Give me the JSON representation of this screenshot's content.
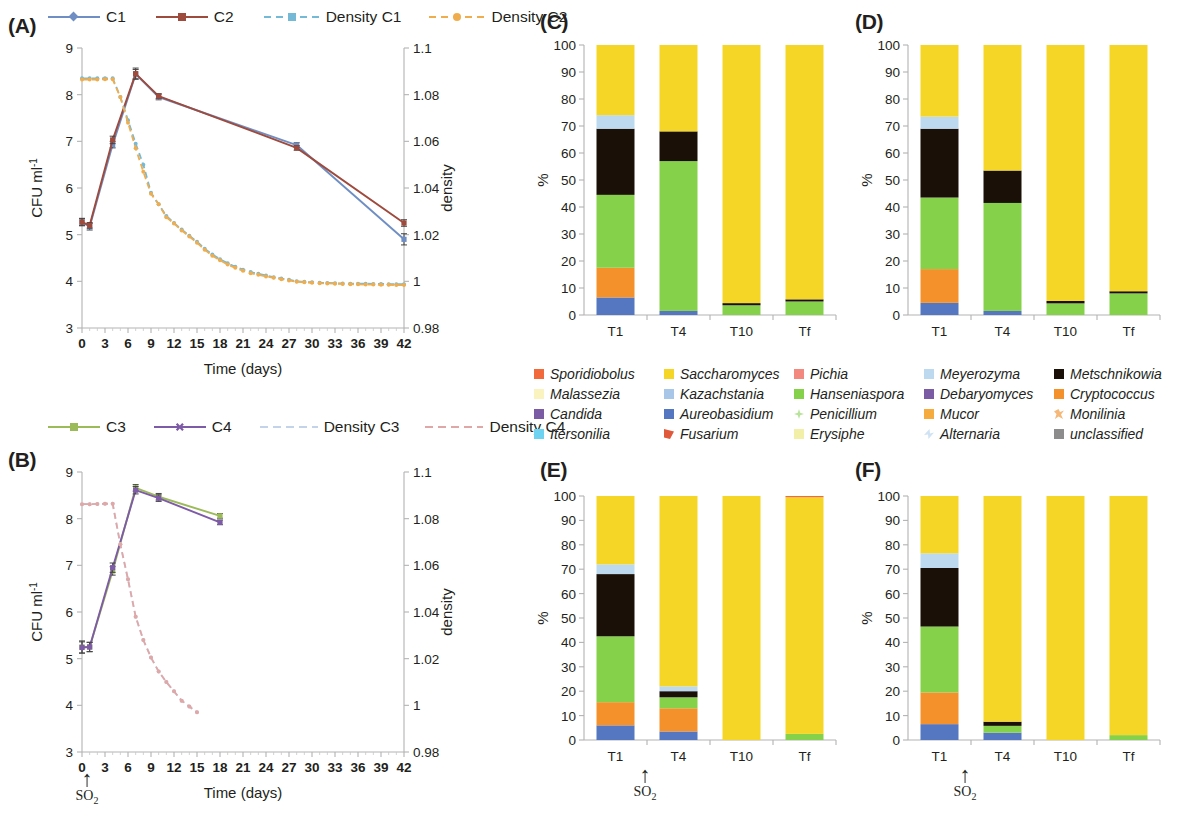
{
  "figure": {
    "panels": [
      "(A)",
      "(B)",
      "(C)",
      "(D)",
      "(E)",
      "(F)"
    ]
  },
  "panelA": {
    "letter": "(A)",
    "legend": [
      {
        "label": "C1",
        "color": "#6f8fc4",
        "style": "solid",
        "marker": "diamond"
      },
      {
        "label": "C2",
        "color": "#9e4a3c",
        "style": "solid",
        "marker": "square"
      },
      {
        "label": "Density C1",
        "color": "#74b9d6",
        "style": "dashed",
        "marker": "square"
      },
      {
        "label": "Density C2",
        "color": "#f0ad4e",
        "style": "dashed",
        "marker": "circle"
      }
    ],
    "chart_data": {
      "type": "line",
      "title": "",
      "xlabel": "Time (days)",
      "ylabel": "CFU ml-1",
      "y2label": "density",
      "xlim": [
        0,
        42
      ],
      "ylim": [
        3,
        9
      ],
      "y2lim": [
        0.98,
        1.1
      ],
      "xticks": [
        0,
        3,
        6,
        9,
        12,
        15,
        18,
        21,
        24,
        27,
        30,
        33,
        36,
        39,
        42
      ],
      "yticks": [
        3,
        4,
        5,
        6,
        7,
        8,
        9
      ],
      "y2ticks": [
        0.98,
        1,
        1.02,
        1.04,
        1.06,
        1.08,
        1.1
      ],
      "grid": false,
      "legend_position": "top",
      "series": [
        {
          "name": "C1",
          "axis": "left",
          "color": "#6f8fc4",
          "x": [
            0,
            1,
            4,
            7,
            10,
            28,
            42
          ],
          "values": [
            5.27,
            5.17,
            6.93,
            8.44,
            7.95,
            6.92,
            4.9
          ],
          "error": [
            0.08,
            0.07,
            0.07,
            0.1,
            0.06,
            0.05,
            0.12
          ]
        },
        {
          "name": "C2",
          "axis": "left",
          "color": "#9e4a3c",
          "x": [
            0,
            1,
            4,
            7,
            10,
            28,
            42
          ],
          "values": [
            5.27,
            5.2,
            7.03,
            8.45,
            7.97,
            6.86,
            5.25
          ],
          "error": [
            0.07,
            0.06,
            0.08,
            0.12,
            0.05,
            0.05,
            0.07
          ]
        },
        {
          "name": "Density C1",
          "axis": "right",
          "color": "#74b9d6",
          "x": [
            0,
            1,
            2,
            3,
            4,
            5,
            6,
            7,
            8,
            9,
            10,
            11,
            12,
            13,
            14,
            15,
            16,
            17,
            18,
            19,
            20,
            21,
            22,
            23,
            24,
            25,
            26,
            27,
            28,
            29,
            30,
            31,
            32,
            33,
            34,
            35,
            36,
            37,
            38,
            39,
            40,
            41,
            42
          ],
          "values": [
            1.087,
            1.087,
            1.087,
            1.087,
            1.087,
            1.079,
            1.069,
            1.059,
            1.05,
            1.038,
            1.033,
            1.028,
            1.025,
            1.0222,
            1.0195,
            1.017,
            1.014,
            1.0115,
            1.0095,
            1.0078,
            1.0062,
            1.005,
            1.004,
            1.0032,
            1.0025,
            1.0018,
            1.0012,
            1.0007,
            1.0,
            0.9998,
            0.9996,
            0.9994,
            0.9993,
            0.9992,
            0.9991,
            0.999,
            0.999,
            0.999,
            0.9989,
            0.9989,
            0.9988,
            0.9988,
            0.9988
          ]
        },
        {
          "name": "Density C2",
          "axis": "right",
          "color": "#f0ad4e",
          "x": [
            0,
            1,
            2,
            3,
            4,
            5,
            6,
            7,
            8,
            9,
            10,
            11,
            12,
            13,
            14,
            15,
            16,
            17,
            18,
            19,
            20,
            21,
            22,
            23,
            24,
            25,
            26,
            27,
            28,
            29,
            30,
            31,
            32,
            33,
            34,
            35,
            36,
            37,
            38,
            39,
            40,
            41,
            42
          ],
          "values": [
            1.0865,
            1.0865,
            1.0865,
            1.0866,
            1.0866,
            1.079,
            1.068,
            1.057,
            1.047,
            1.0375,
            1.033,
            1.0275,
            1.0248,
            1.0218,
            1.0192,
            1.0165,
            1.0135,
            1.011,
            1.009,
            1.0072,
            1.0058,
            1.0045,
            1.0035,
            1.0028,
            1.0021,
            1.0015,
            1.0009,
            1.0004,
            0.9998,
            0.9996,
            0.9994,
            0.9992,
            0.9991,
            0.999,
            0.9989,
            0.9988,
            0.9987,
            0.9986,
            0.9986,
            0.9985,
            0.9985,
            0.9984,
            0.9984
          ]
        }
      ]
    }
  },
  "panelB": {
    "letter": "(B)",
    "legend": [
      {
        "label": "C3",
        "color": "#9bbb59",
        "style": "solid",
        "marker": "square"
      },
      {
        "label": "C4",
        "color": "#7d5ba6",
        "style": "solid",
        "marker": "x"
      },
      {
        "label": "Density C3",
        "color": "#c3d4ea",
        "style": "dashed",
        "marker": "none"
      },
      {
        "label": "Density C4",
        "color": "#e0a7a7",
        "style": "dashed",
        "marker": "none"
      }
    ],
    "so2_label": "SO2",
    "chart_data": {
      "type": "line",
      "title": "",
      "xlabel": "Time (days)",
      "ylabel": "CFU ml-1",
      "y2label": "density",
      "xlim": [
        0,
        42
      ],
      "ylim": [
        3,
        9
      ],
      "y2lim": [
        0.98,
        1.1
      ],
      "xticks": [
        0,
        3,
        6,
        9,
        12,
        15,
        18,
        21,
        24,
        27,
        30,
        33,
        36,
        39,
        42
      ],
      "yticks": [
        3,
        4,
        5,
        6,
        7,
        8,
        9
      ],
      "y2ticks": [
        0.98,
        1,
        1.02,
        1.04,
        1.06,
        1.08,
        1.1
      ],
      "grid": false,
      "legend_position": "top",
      "so2_addition_day": 1,
      "series": [
        {
          "name": "C3",
          "axis": "left",
          "color": "#9bbb59",
          "x": [
            0,
            1,
            4,
            7,
            10,
            18
          ],
          "values": [
            5.25,
            5.25,
            6.88,
            8.66,
            8.47,
            8.06
          ],
          "error": [
            0.13,
            0.1,
            0.09,
            0.07,
            0.07,
            0.05
          ]
        },
        {
          "name": "C4",
          "axis": "left",
          "color": "#7d5ba6",
          "x": [
            0,
            1,
            4,
            7,
            10,
            18
          ],
          "values": [
            5.24,
            5.25,
            6.95,
            8.61,
            8.44,
            7.92
          ],
          "error": [
            0.12,
            0.1,
            0.1,
            0.08,
            0.07,
            0.05
          ]
        },
        {
          "name": "Density C3",
          "axis": "right",
          "color": "#c3d4ea",
          "x": [
            0,
            1,
            2,
            3,
            4,
            5,
            6,
            7,
            8,
            9,
            10,
            11,
            12,
            13,
            14,
            15
          ],
          "values": [
            1.0862,
            1.0862,
            1.0863,
            1.0864,
            1.0864,
            1.069,
            1.054,
            1.038,
            1.028,
            1.0205,
            1.0145,
            1.01,
            1.006,
            1.002,
            0.9995,
            0.997
          ]
        },
        {
          "name": "Density C4",
          "axis": "right",
          "color": "#e0a7a7",
          "x": [
            0,
            1,
            2,
            3,
            4,
            5,
            6,
            7,
            8,
            9,
            10,
            11,
            12,
            13,
            14,
            15
          ],
          "values": [
            1.0862,
            1.0862,
            1.0863,
            1.0864,
            1.0864,
            1.069,
            1.054,
            1.038,
            1.028,
            1.0205,
            1.0145,
            1.01,
            1.006,
            1.002,
            0.9995,
            0.997
          ]
        }
      ]
    }
  },
  "taxa_legend": {
    "items": [
      {
        "name": "Sporidiobolus",
        "color": "#f2693c"
      },
      {
        "name": "Malassezia",
        "color": "#faf3c0"
      },
      {
        "name": "Candida",
        "color": "#7b5ba3"
      },
      {
        "name": "Itersonilia",
        "color": "#6ed3f0"
      },
      {
        "name": "Saccharomyces",
        "color": "#f5d525"
      },
      {
        "name": "Kazachstania",
        "color": "#a8c7e8"
      },
      {
        "name": "Aureobasidium",
        "color": "#5577c2"
      },
      {
        "name": "Fusarium",
        "color": "#e0593a"
      },
      {
        "name": "Pichia",
        "color": "#f2887e"
      },
      {
        "name": "Hanseniaspora",
        "color": "#86d14a"
      },
      {
        "name": "Penicillium",
        "color": "#b9e39b"
      },
      {
        "name": "Erysiphe",
        "color": "#f2f0a8"
      },
      {
        "name": "Meyerozyma",
        "color": "#bcd9f0"
      },
      {
        "name": "Debaryomyces",
        "color": "#7b5ba3"
      },
      {
        "name": "Mucor",
        "color": "#f5ab3d"
      },
      {
        "name": "Alternaria",
        "color": "#cfe3f2"
      },
      {
        "name": "Metschnikowia",
        "color": "#1a1008"
      },
      {
        "name": "Cryptococcus",
        "color": "#f5912a"
      },
      {
        "name": "Monilinia",
        "color": "#f5b878"
      },
      {
        "name": "unclassified",
        "color": "#8c8c8c"
      }
    ]
  },
  "panelC": {
    "letter": "(C)",
    "chart_data": {
      "type": "bar",
      "subtype": "stacked",
      "title": "",
      "xlabel": "",
      "ylabel": "%",
      "ylim": [
        0,
        100
      ],
      "yticks": [
        0,
        10,
        20,
        30,
        40,
        50,
        60,
        70,
        80,
        90,
        100
      ],
      "categories": [
        "T1",
        "T4",
        "T10",
        "Tf"
      ],
      "grid": false,
      "series": [
        {
          "name": "Aureobasidium",
          "color": "#5577c2",
          "values": [
            6.5,
            1.5,
            0,
            0
          ]
        },
        {
          "name": "Cryptococcus",
          "color": "#f5912a",
          "values": [
            11.0,
            0,
            0,
            0
          ]
        },
        {
          "name": "Hanseniaspora",
          "color": "#86d14a",
          "values": [
            27.0,
            55.5,
            3.6,
            5.0
          ]
        },
        {
          "name": "Metschnikowia",
          "color": "#1a1008",
          "values": [
            24.5,
            11.0,
            0.8,
            0.8
          ]
        },
        {
          "name": "Meyerozyma",
          "color": "#bcd9f0",
          "values": [
            5.0,
            0,
            0,
            0
          ]
        },
        {
          "name": "Saccharomyces",
          "color": "#f5d525",
          "values": [
            26.0,
            32.0,
            95.6,
            94.2
          ]
        }
      ]
    }
  },
  "panelD": {
    "letter": "(D)",
    "chart_data": {
      "type": "bar",
      "subtype": "stacked",
      "title": "",
      "xlabel": "",
      "ylabel": "%",
      "ylim": [
        0,
        100
      ],
      "yticks": [
        0,
        10,
        20,
        30,
        40,
        50,
        60,
        70,
        80,
        90,
        100
      ],
      "categories": [
        "T1",
        "T4",
        "T10",
        "Tf"
      ],
      "grid": false,
      "series": [
        {
          "name": "Aureobasidium",
          "color": "#5577c2",
          "values": [
            4.5,
            1.5,
            0,
            0
          ]
        },
        {
          "name": "Cryptococcus",
          "color": "#f5912a",
          "values": [
            12.5,
            0,
            0,
            0
          ]
        },
        {
          "name": "Hanseniaspora",
          "color": "#86d14a",
          "values": [
            26.5,
            40.0,
            4.3,
            8.0
          ]
        },
        {
          "name": "Metschnikowia",
          "color": "#1a1008",
          "values": [
            25.5,
            12.0,
            0.9,
            0.8
          ]
        },
        {
          "name": "Meyerozyma",
          "color": "#bcd9f0",
          "values": [
            4.5,
            0,
            0,
            0
          ]
        },
        {
          "name": "Saccharomyces",
          "color": "#f5d525",
          "values": [
            26.5,
            46.5,
            94.8,
            91.2
          ]
        }
      ]
    }
  },
  "panelE": {
    "letter": "(E)",
    "so2_label": "SO2",
    "chart_data": {
      "type": "bar",
      "subtype": "stacked",
      "title": "",
      "xlabel": "",
      "ylabel": "%",
      "ylim": [
        0,
        100
      ],
      "yticks": [
        0,
        10,
        20,
        30,
        40,
        50,
        60,
        70,
        80,
        90,
        100
      ],
      "categories": [
        "T1",
        "T4",
        "T10",
        "Tf"
      ],
      "grid": false,
      "so2_after_category": "T1",
      "series": [
        {
          "name": "Aureobasidium",
          "color": "#5577c2",
          "values": [
            6.0,
            3.5,
            0,
            0
          ]
        },
        {
          "name": "Cryptococcus",
          "color": "#f5912a",
          "values": [
            9.5,
            9.5,
            0,
            0
          ]
        },
        {
          "name": "Hanseniaspora",
          "color": "#86d14a",
          "values": [
            27.0,
            4.5,
            0,
            2.5
          ]
        },
        {
          "name": "Metschnikowia",
          "color": "#1a1008",
          "values": [
            25.5,
            2.5,
            0,
            0
          ]
        },
        {
          "name": "Meyerozyma",
          "color": "#bcd9f0",
          "values": [
            4.0,
            2.0,
            0,
            0
          ]
        },
        {
          "name": "Saccharomyces",
          "color": "#f5d525",
          "values": [
            28.0,
            78.0,
            100.0,
            97.0
          ]
        },
        {
          "name": "Sporidiobolus",
          "color": "#f2693c",
          "values": [
            0,
            0,
            0,
            0.5
          ]
        }
      ]
    }
  },
  "panelF": {
    "letter": "(F)",
    "so2_label": "SO2",
    "chart_data": {
      "type": "bar",
      "subtype": "stacked",
      "title": "",
      "xlabel": "",
      "ylabel": "%",
      "ylim": [
        0,
        100
      ],
      "yticks": [
        0,
        10,
        20,
        30,
        40,
        50,
        60,
        70,
        80,
        90,
        100
      ],
      "categories": [
        "T1",
        "T4",
        "T10",
        "Tf"
      ],
      "grid": false,
      "so2_after_category": "T1",
      "series": [
        {
          "name": "Aureobasidium",
          "color": "#5577c2",
          "values": [
            6.5,
            3.0,
            0,
            0
          ]
        },
        {
          "name": "Cryptococcus",
          "color": "#f5912a",
          "values": [
            13.0,
            0,
            0,
            0
          ]
        },
        {
          "name": "Hanseniaspora",
          "color": "#86d14a",
          "values": [
            27.0,
            2.8,
            0,
            2.0
          ]
        },
        {
          "name": "Metschnikowia",
          "color": "#1a1008",
          "values": [
            24.0,
            1.7,
            0,
            0
          ]
        },
        {
          "name": "Meyerozyma",
          "color": "#bcd9f0",
          "values": [
            6.0,
            0,
            0,
            0
          ]
        },
        {
          "name": "Saccharomyces",
          "color": "#f5d525",
          "values": [
            23.5,
            92.5,
            100.0,
            98.0
          ]
        }
      ]
    }
  }
}
